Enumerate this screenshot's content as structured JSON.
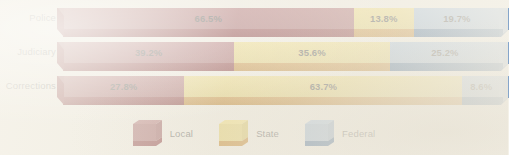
{
  "chart_data": {
    "type": "bar",
    "subtype": "stacked-horizontal-100-percent",
    "title": "",
    "xlabel": "",
    "ylabel": "",
    "xlim": [
      0,
      100
    ],
    "grid": false,
    "legend_position": "bottom-center",
    "categories": [
      "Police",
      "Judiciary",
      "Corrections"
    ],
    "series": [
      {
        "name": "Local",
        "color": "#9c525a",
        "values": [
          66.5,
          39.2,
          27.8
        ]
      },
      {
        "name": "State",
        "color": "#e7d169",
        "values": [
          13.8,
          35.6,
          63.7
        ]
      },
      {
        "name": "Federal",
        "color": "#8fafd4",
        "values": [
          19.7,
          25.2,
          8.6
        ]
      }
    ],
    "data_labels": [
      [
        "66.5%",
        "13.8%",
        "19.7%"
      ],
      [
        "39.2%",
        "35.6%",
        "25.2%"
      ],
      [
        "27.8%",
        "63.7%",
        "8.6%"
      ]
    ]
  },
  "rows": [
    {
      "label": "Police",
      "segments": [
        {
          "series": "Local",
          "value": 66.5,
          "label": "66.5%"
        },
        {
          "series": "State",
          "value": 13.8,
          "label": "13.8%"
        },
        {
          "series": "Federal",
          "value": 19.7,
          "label": "19.7%"
        }
      ]
    },
    {
      "label": "Judiciary",
      "segments": [
        {
          "series": "Local",
          "value": 39.2,
          "label": "39.2%"
        },
        {
          "series": "State",
          "value": 35.6,
          "label": "35.6%"
        },
        {
          "series": "Federal",
          "value": 25.2,
          "label": "25.2%"
        }
      ]
    },
    {
      "label": "Corrections",
      "segments": [
        {
          "series": "Local",
          "value": 27.8,
          "label": "27.8%"
        },
        {
          "series": "State",
          "value": 63.7,
          "label": "63.7%"
        },
        {
          "series": "Federal",
          "value": 8.6,
          "label": "8.6%"
        }
      ]
    }
  ],
  "legend": {
    "items": [
      {
        "label": "Local",
        "icon": "cube-icon",
        "color_front": "#9c525a",
        "color_bottom": "#7b1c24"
      },
      {
        "label": "State",
        "icon": "cube-icon",
        "color_front": "#e7d169",
        "color_bottom": "#c5811d"
      },
      {
        "label": "Federal",
        "icon": "cube-icon",
        "color_front": "#8fafd4",
        "color_bottom": "#26578f"
      }
    ]
  },
  "palette": {
    "local_front": "#9c525a",
    "local_bottom": "#7b1c24",
    "state_front": "#e7d169",
    "state_bottom": "#c5811d",
    "federal_front": "#8fafd4",
    "federal_bottom": "#26578f",
    "background": "#f4f1e8",
    "label_text": "#585858",
    "value_text": "#2b2b2b"
  }
}
